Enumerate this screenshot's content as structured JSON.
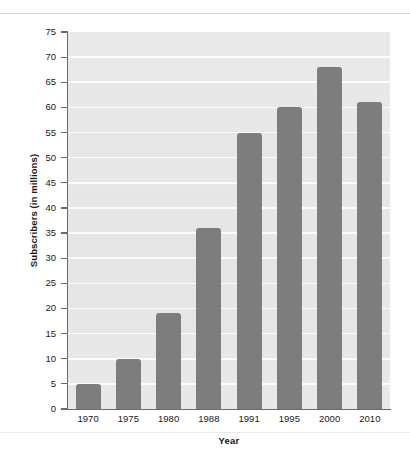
{
  "chart_data": {
    "type": "bar",
    "title": "",
    "subtitle": "",
    "xlabel": "Year",
    "ylabel": "Subscribers (in millions)",
    "categories": [
      "1970",
      "1975",
      "1980",
      "1988",
      "1991",
      "1995",
      "2000",
      "2010"
    ],
    "values": [
      5,
      10,
      19,
      36,
      55,
      60,
      68,
      61
    ],
    "series": [
      {
        "name": "Subscribers",
        "values": [
          5,
          10,
          19,
          36,
          55,
          60,
          68,
          61
        ]
      }
    ],
    "ylim": [
      0,
      75
    ],
    "ytick_labels": [
      "0",
      "5",
      "10",
      "15",
      "20",
      "25",
      "30",
      "35",
      "40",
      "45",
      "50",
      "55",
      "60",
      "65",
      "70",
      "75"
    ],
    "ytick_values": [
      0,
      5,
      10,
      15,
      20,
      25,
      30,
      35,
      40,
      45,
      50,
      55,
      60,
      65,
      70,
      75
    ],
    "ytick_step": 5,
    "grid": true,
    "grid_axis": "y",
    "grid_color": "#fbfbfb",
    "legend": false,
    "legend_position": "none",
    "bar_color": "#7d7d7d",
    "plot_background": "#e7e7e7",
    "axis_color": "#6a6a6a",
    "text_color": "#1a1a1a",
    "page_background": "#ffffff"
  }
}
